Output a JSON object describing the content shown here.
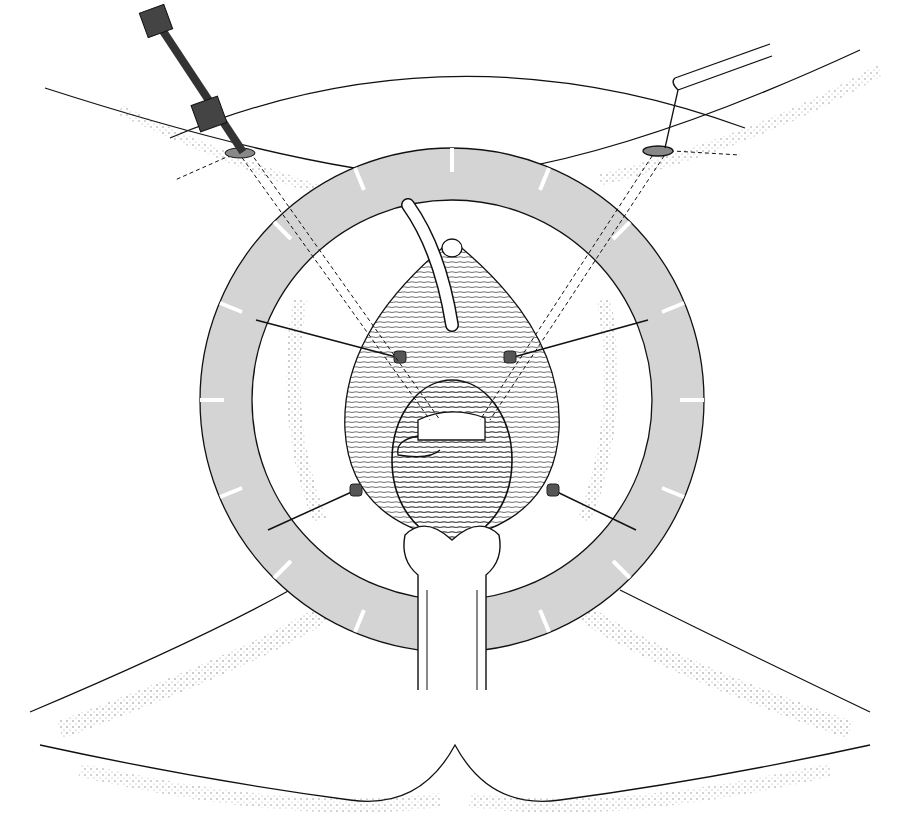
{
  "illustration": {
    "subject": "surgical-illustration",
    "style": "black line drawing with stippling",
    "colors": {
      "ring_fill": "#d4d4d4",
      "line": "#111111",
      "instrument": "#444444",
      "background": "#ffffff"
    },
    "elements": [
      "ring-retractor",
      "trocar-left",
      "grasper-right",
      "catheter",
      "speculum-blade",
      "retractor-hooks"
    ]
  }
}
